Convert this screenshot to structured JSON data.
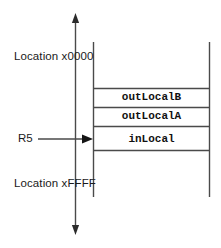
{
  "diagram": {
    "type": "memory-stack-diagram",
    "colors": {
      "line": "#4a4a4a",
      "text": "#1a1a1a",
      "background": "#ffffff"
    },
    "address_labels": {
      "top": "Location x0000",
      "bottom": "Location xFFFF"
    },
    "pointers": [
      {
        "name": "R5",
        "label": "R5",
        "points_to": "inLocal",
        "direction": "right"
      }
    ],
    "growth_arrows": [
      {
        "name": "toward-low-addresses",
        "direction": "up"
      },
      {
        "name": "toward-high-addresses",
        "direction": "down"
      }
    ],
    "stack_cells": [
      {
        "label": "outLocalB"
      },
      {
        "label": "outLocalA"
      },
      {
        "label": "inLocal"
      }
    ]
  }
}
